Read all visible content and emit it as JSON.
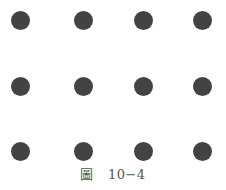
{
  "figure": {
    "dot_color": "#434343",
    "columns_x": [
      20,
      83,
      143,
      202
    ],
    "rows_y": [
      20,
      86,
      151
    ],
    "dot_radius": 9.5,
    "grid": "3 rows x 4 columns of dots"
  },
  "caption": {
    "prefix": "圖",
    "number": "10−4"
  }
}
